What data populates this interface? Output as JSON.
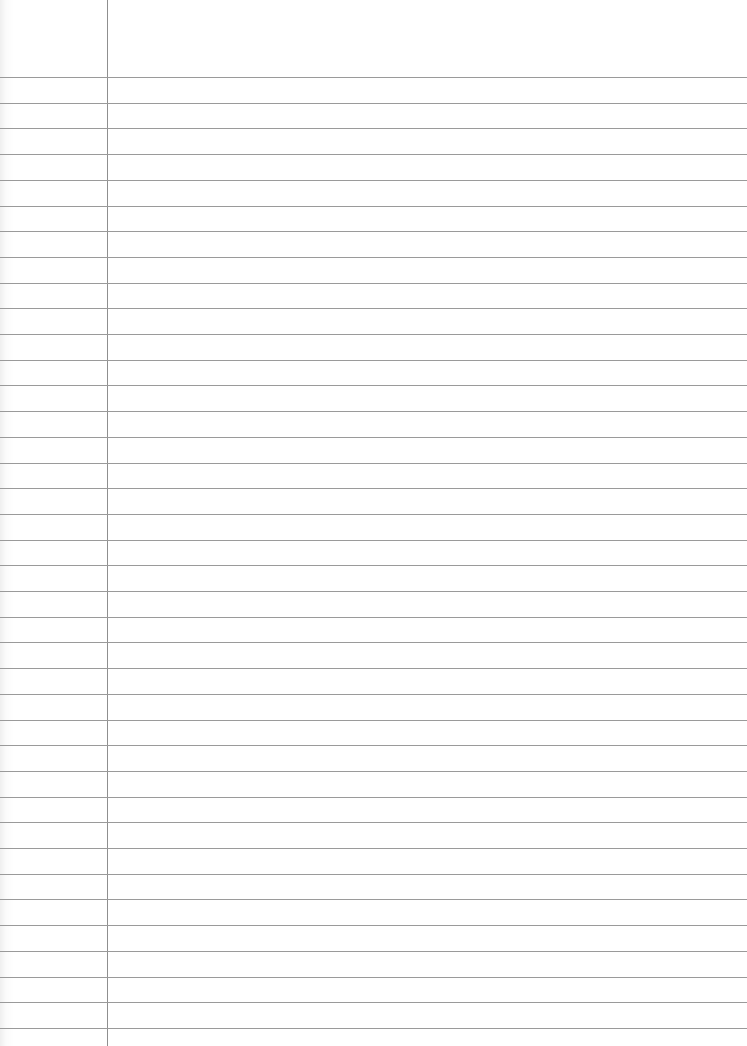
{
  "document": {
    "type": "lined-paper",
    "background_color": "#ffffff",
    "rule_color": "#9a9a9a",
    "margin_color": "#8f8f8f",
    "margin_x": 107,
    "first_rule_y": 77,
    "rule_spacing": 25.7,
    "rule_count": 38,
    "text_lines": []
  }
}
